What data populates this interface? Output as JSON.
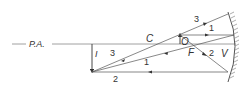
{
  "colors": {
    "line": "#555555",
    "text": "#333333",
    "axis": "#888888",
    "background": "#ffffff"
  },
  "labels": {
    "principal_axis": "P.A.",
    "image": "I",
    "center_of_curvature": "C",
    "object": "O",
    "focus": "F",
    "vertex": "V",
    "ray1": "1",
    "ray1_reflected": "1",
    "ray2": "2",
    "ray2_reflected": "2",
    "ray3": "3",
    "ray3_reflected": "3"
  }
}
